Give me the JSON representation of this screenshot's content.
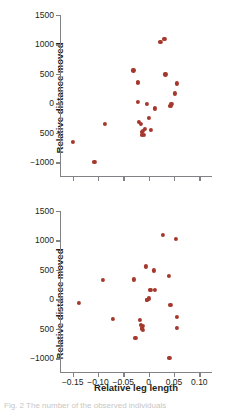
{
  "figure": {
    "axis_color": "#808285",
    "point_color": "#a5382c",
    "text_color": "#231f20",
    "caption_fragment": "Fig. 2  The number of the observed individuals"
  },
  "chart_data": [
    {
      "type": "scatter",
      "panel": "top",
      "title": "",
      "xlabel": "",
      "ylabel": "Relative distance moved",
      "xlim": [
        -0.175,
        0.125
      ],
      "ylim": [
        -1250,
        1500
      ],
      "grid": false,
      "legend": null,
      "xticks": [
        -0.15,
        -0.1,
        -0.05,
        0,
        0.05,
        0.1
      ],
      "xtick_labels": [
        "",
        "",
        "",
        "",
        "",
        ""
      ],
      "yticks": [
        1500,
        1000,
        500,
        0,
        -500,
        -1000
      ],
      "ytick_labels": [
        "1500",
        "1000",
        "500",
        "0",
        "500",
        "−1000"
      ],
      "x": [
        -0.15,
        -0.107,
        -0.087,
        -0.03,
        -0.022,
        -0.022,
        -0.022,
        -0.02,
        -0.015,
        -0.013,
        -0.013,
        -0.012,
        -0.01,
        -0.007,
        -0.004,
        0.001,
        0.004,
        0.012,
        0.023,
        0.031,
        0.033,
        0.043,
        0.045,
        0.052,
        0.055
      ],
      "y": [
        -660,
        -990,
        -350,
        560,
        345,
        360,
        20,
        -320,
        -350,
        -480,
        -530,
        -470,
        -540,
        -430,
        -5,
        -240,
        -450,
        -85,
        1040,
        1100,
        490,
        -50,
        -5,
        170,
        340
      ]
    },
    {
      "type": "scatter",
      "panel": "bottom",
      "title": "",
      "xlabel": "Relative leg length",
      "ylabel": "Relative distance moved",
      "xlim": [
        -0.175,
        0.125
      ],
      "ylim": [
        -1250,
        1500
      ],
      "grid": false,
      "legend": null,
      "xticks": [
        -0.15,
        -0.1,
        -0.05,
        0,
        0.05,
        0.1
      ],
      "xtick_labels": [
        "−0.15",
        "−0.10",
        "−0.05",
        "0",
        "0.05",
        "0.10"
      ],
      "yticks": [
        1500,
        1000,
        500,
        0,
        -500,
        -1000
      ],
      "ytick_labels": [
        "1500",
        "1000",
        "500",
        "0",
        "500",
        "−1000"
      ],
      "x": [
        -0.137,
        -0.09,
        -0.07,
        -0.029,
        -0.026,
        -0.017,
        -0.015,
        -0.014,
        -0.013,
        -0.012,
        -0.011,
        -0.005,
        -0.004,
        -0.003,
        0.001,
        0.003,
        0.004,
        0.011,
        0.013,
        0.028,
        0.04,
        0.041,
        0.043,
        0.053,
        0.055,
        0.056
      ],
      "y": [
        -60,
        335,
        -330,
        340,
        -660,
        -350,
        -440,
        -480,
        -500,
        -520,
        -455,
        560,
        -10,
        -5,
        15,
        165,
        160,
        490,
        155,
        1090,
        405,
        -1000,
        -90,
        1030,
        -300,
        -490
      ]
    }
  ],
  "labels": {
    "ylabel_top": "Relative distance moved",
    "ylabel_bottom": "Relative distance moved",
    "xlabel_bottom": "Relative leg length"
  }
}
